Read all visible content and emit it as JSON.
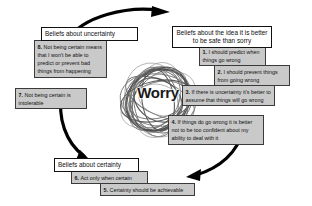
{
  "diagram": {
    "title": "Worry",
    "center_label": "Worry",
    "center_icon": "scribble-tangle",
    "cycle_arrow_icon": "circular-arrow",
    "colors": {
      "box_fill": "#c9c9c9",
      "box_border": "#3a3a3a",
      "heading_fill": "#ffffff",
      "heading_border": "#111111",
      "arc": "#000000",
      "text": "#111111",
      "background": "#ffffff"
    },
    "groups": [
      {
        "id": "uncertainty",
        "heading": "Beliefs about uncertainty",
        "items": [
          {
            "number": "8.",
            "text": "Not being certain means that I won't be able to predict or prevent bad things from happening"
          },
          {
            "number": "7.",
            "text": "Not being certain is intolerable"
          }
        ]
      },
      {
        "id": "safe-than-sorry",
        "heading": "Beliefs about the idea it is better to be safe than sorry",
        "items": [
          {
            "number": "1.",
            "text": "I should predict when things go wrong"
          },
          {
            "number": "2.",
            "text": "I should prevent things from going wrong"
          },
          {
            "number": "3.",
            "text": "If there is uncertainty it's better to assume that things will go wrong"
          },
          {
            "number": "4.",
            "text": "If things do go wrong it is better not to be too confident about my ability to deal with it"
          }
        ]
      },
      {
        "id": "certainty",
        "heading": "Beliefs about certainty",
        "items": [
          {
            "number": "6.",
            "text": "Act only when certain"
          },
          {
            "number": "5.",
            "text": "Certainty should be achievable"
          }
        ]
      }
    ]
  }
}
